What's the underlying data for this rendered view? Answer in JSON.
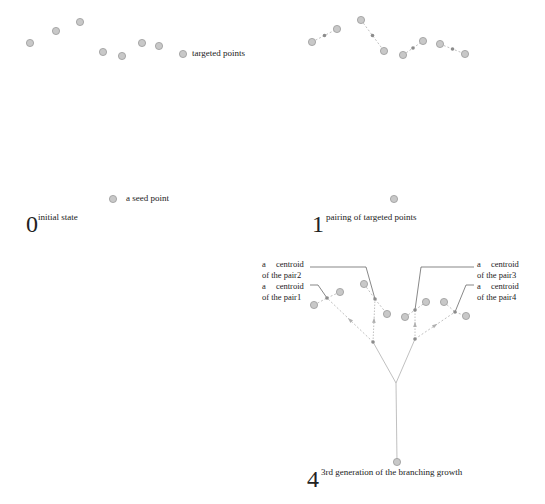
{
  "colors": {
    "point_fill": "#c8c8c8",
    "point_stroke": "#9a9a9a",
    "centroid_fill": "#8c8c8c",
    "line": "#b0b0b0",
    "leader": "#555555",
    "text": "#222222"
  },
  "panels": {
    "initial": {
      "number": "0",
      "caption": "initial state",
      "targets_label": "targeted points",
      "seed_label": "a seed point"
    },
    "pairing": {
      "number": "1",
      "caption": "pairing of targeted points"
    },
    "branching": {
      "number": "4",
      "caption": "3rd generation of the branching growth",
      "centroid_labels": [
        {
          "line1": "a  centroid",
          "line2": "of the pair2"
        },
        {
          "line1": "a  centroid",
          "line2": "of the pair1"
        },
        {
          "line1": "a  centroid",
          "line2": "of the pair3"
        },
        {
          "line1": "a  centroid",
          "line2": "of the pair4"
        }
      ]
    }
  },
  "geometry": {
    "panel0_targets": [
      [
        30,
        43
      ],
      [
        56,
        31
      ],
      [
        80,
        22
      ],
      [
        103,
        52
      ],
      [
        122,
        56
      ],
      [
        142,
        43
      ],
      [
        159,
        46
      ],
      [
        183,
        54
      ]
    ],
    "panel0_seed": [
      113,
      199
    ],
    "panel1_targets": [
      [
        312,
        42
      ],
      [
        337,
        29
      ],
      [
        361,
        20
      ],
      [
        384,
        51
      ],
      [
        403,
        55
      ],
      [
        423,
        41
      ],
      [
        440,
        44
      ],
      [
        465,
        54
      ]
    ],
    "panel1_seed": [
      394,
      199
    ],
    "panel4_targets": [
      [
        314,
        305
      ],
      [
        340,
        292
      ],
      [
        364,
        284
      ],
      [
        387,
        314
      ],
      [
        405,
        317
      ],
      [
        426,
        302
      ],
      [
        444,
        302
      ],
      [
        466,
        316
      ]
    ],
    "panel4_centroids": [
      [
        327,
        298
      ],
      [
        375,
        299
      ],
      [
        415,
        310
      ],
      [
        455,
        312
      ]
    ],
    "panel4_junctions": [
      [
        373,
        342
      ],
      [
        415,
        339
      ]
    ],
    "panel4_root": [
      396,
      383
    ],
    "panel4_seed": [
      397,
      462
    ]
  }
}
